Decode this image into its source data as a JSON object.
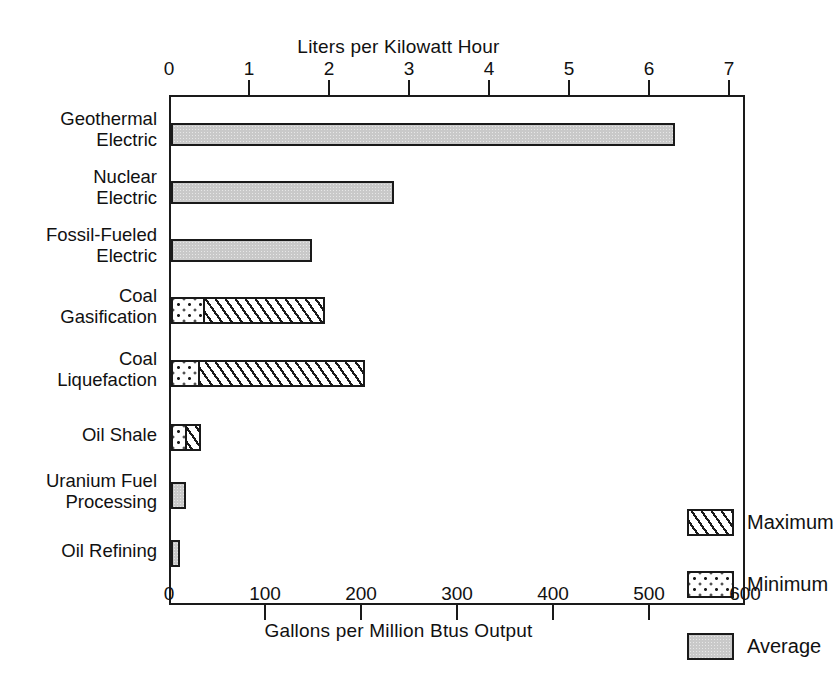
{
  "chart_data": {
    "type": "bar",
    "orientation": "horizontal",
    "title": "",
    "top_axis_label": "Liters per Kilowatt Hour",
    "bottom_axis_label": "Gallons per Million Btus Output",
    "ylabel": "",
    "xlim": [
      0,
      600
    ],
    "top_xlim": [
      0,
      7
    ],
    "grid": false,
    "legend_position": "inside-right",
    "top_ticks": [
      "0",
      "1",
      "2",
      "3",
      "4",
      "5",
      "6",
      "7"
    ],
    "top_tick_values": [
      0,
      1,
      2,
      3,
      4,
      5,
      6,
      7
    ],
    "bottom_ticks": [
      "0",
      "100",
      "200",
      "300",
      "400",
      "500",
      "600"
    ],
    "bottom_tick_values": [
      0,
      100,
      200,
      300,
      400,
      500,
      600
    ],
    "categories": [
      "Geothermal\nElectric",
      "Nuclear\nElectric",
      "Fossil-Fueled\nElectric",
      "Coal\nGasification",
      "Coal\nLiquefaction",
      "Oil Shale",
      "Uranium Fuel\nProcessing",
      "Oil Refining"
    ],
    "series": [
      {
        "name": "Average",
        "pattern": "solid-gray",
        "values": [
          525,
          232,
          147,
          null,
          null,
          null,
          16,
          9
        ]
      },
      {
        "name": "Minimum",
        "pattern": "dotted",
        "values": [
          null,
          null,
          null,
          35,
          30,
          17,
          null,
          null
        ]
      },
      {
        "name": "Maximum",
        "pattern": "diagonal-hatch",
        "values": [
          null,
          null,
          null,
          160,
          202,
          31,
          null,
          null
        ]
      }
    ],
    "legend_entries": [
      {
        "label": "Maximum",
        "pattern": "diagonal-hatch"
      },
      {
        "label": "Minimum",
        "pattern": "dotted"
      },
      {
        "label": "Average",
        "pattern": "solid-gray"
      }
    ],
    "colors": {
      "average_fill": "#c9c9c9",
      "outline": "#1a1a1a",
      "background": "#ffffff"
    }
  }
}
